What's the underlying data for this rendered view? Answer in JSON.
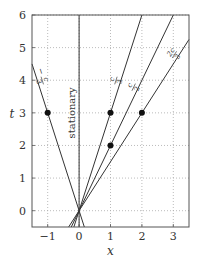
{
  "chart_data": {
    "type": "line",
    "title": "",
    "xlabel": "x",
    "ylabel": "t",
    "xlim": [
      -1.5,
      3.5
    ],
    "ylim": [
      -0.5,
      6
    ],
    "xticks": [
      -1,
      0,
      1,
      2,
      3
    ],
    "yticks": [
      0,
      1,
      2,
      3,
      4,
      5,
      6
    ],
    "xtick_labels": [
      "−1",
      "0",
      "1",
      "2",
      "3"
    ],
    "ytick_labels": [
      "0",
      "1",
      "2",
      "3",
      "4",
      "5",
      "6"
    ],
    "grid": true,
    "series": [
      {
        "name": "stationary",
        "label": "stationary",
        "velocity": 0
      },
      {
        "name": "-c/3",
        "label_num": "c",
        "label_den": "3",
        "label_sign": "−",
        "velocity": -0.3333
      },
      {
        "name": "c/3",
        "label_num": "c",
        "label_den": "3",
        "label_sign": "",
        "velocity": 0.3333
      },
      {
        "name": "c/2",
        "label_num": "c",
        "label_den": "2",
        "label_sign": "",
        "velocity": 0.5
      },
      {
        "name": "2c/3",
        "label_num": "2c",
        "label_den": "3",
        "label_sign": "",
        "velocity": 0.6667
      }
    ],
    "points": [
      {
        "x": -1,
        "t": 3
      },
      {
        "x": 1,
        "t": 3
      },
      {
        "x": 1,
        "t": 2
      },
      {
        "x": 2,
        "t": 3
      }
    ]
  }
}
